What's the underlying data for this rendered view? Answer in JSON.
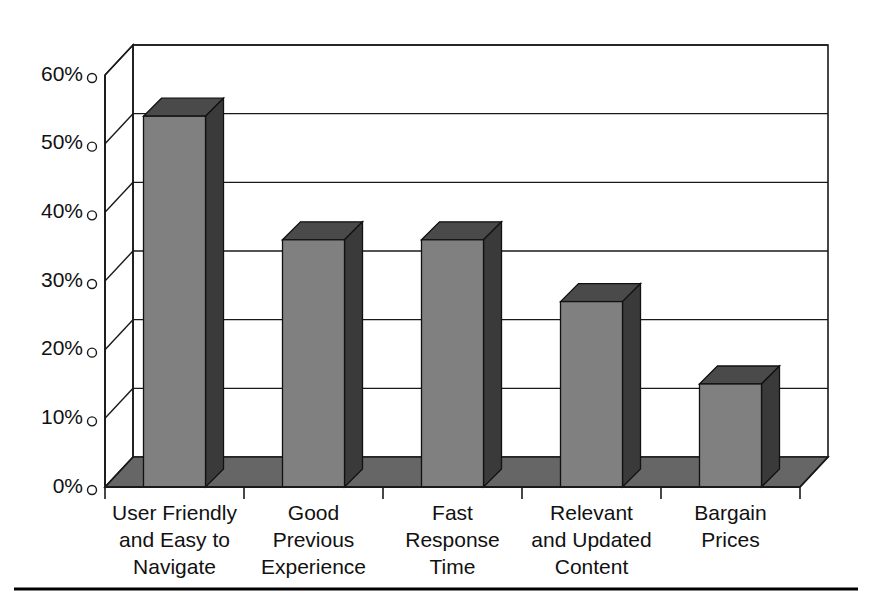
{
  "chart_data": {
    "type": "bar",
    "title": "",
    "subtitle": "",
    "xlabel": "",
    "ylabel": "",
    "categories": [
      "User Friendly and Easy to Navigate",
      "Good Previous Experience",
      "Fast Response Time",
      "Relevant and Updated Content",
      "Bargain Prices"
    ],
    "category_lines": [
      [
        "User Friendly",
        "and Easy to",
        "Navigate"
      ],
      [
        "Good",
        "Previous",
        "Experience"
      ],
      [
        "Fast",
        "Response",
        "Time"
      ],
      [
        "Relevant",
        "and Updated",
        "Content"
      ],
      [
        "Bargain",
        "Prices"
      ]
    ],
    "values": [
      54,
      36,
      36,
      27,
      15
    ],
    "ylim": [
      0,
      60
    ],
    "ytick_values": [
      0,
      10,
      20,
      30,
      40,
      50,
      60
    ],
    "ytick_labels": [
      "0%",
      "10%",
      "20%",
      "30%",
      "40%",
      "50%",
      "60%"
    ],
    "grid": true,
    "legend": false,
    "legend_position": "none",
    "style": "3d-column",
    "colors": {
      "bar_front": "#808080",
      "bar_side": "#3a3a3a",
      "bar_top": "#4a4a4a",
      "floor": "#666666",
      "axis": "#1a1a1a",
      "grid": "#1a1a1a",
      "background": "#ffffff",
      "rule": "#000000"
    }
  },
  "footer": {
    "rule_visible": "true"
  }
}
